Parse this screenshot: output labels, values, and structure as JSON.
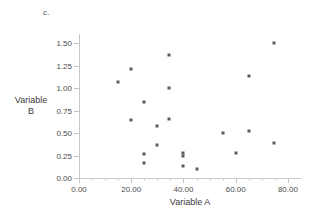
{
  "panel": {
    "label": "c."
  },
  "chart_data": {
    "type": "scatter",
    "title": "",
    "subtitle": "",
    "xlabel": "Variable A",
    "ylabel_line1": "Variable",
    "ylabel_line2": "B",
    "ylabel": "Variable B",
    "xlim": [
      0,
      85
    ],
    "ylim": [
      0,
      1.6
    ],
    "grid": false,
    "legend": null,
    "marker": {
      "shape": "square",
      "color": "#5a5a64",
      "size_px": 3
    },
    "xticks": [
      0,
      20,
      40,
      60,
      80
    ],
    "xtick_labels": [
      "0.00",
      "20.00",
      "40.00",
      "60.00",
      "80.00"
    ],
    "xticks_minor": [
      5,
      10,
      15,
      25,
      30,
      35,
      45,
      50,
      55,
      65,
      70,
      75
    ],
    "yticks": [
      0.0,
      0.25,
      0.5,
      0.75,
      1.0,
      1.25,
      1.5
    ],
    "ytick_labels": [
      "0.00",
      "0.25",
      "0.50",
      "0.75",
      "1.00",
      "1.25",
      "1.50"
    ],
    "points": [
      {
        "x": 15.0,
        "y": 1.07
      },
      {
        "x": 20.0,
        "y": 1.21
      },
      {
        "x": 20.0,
        "y": 0.64
      },
      {
        "x": 25.0,
        "y": 0.84
      },
      {
        "x": 25.0,
        "y": 0.27
      },
      {
        "x": 25.0,
        "y": 0.17
      },
      {
        "x": 30.0,
        "y": 0.58
      },
      {
        "x": 30.0,
        "y": 0.37
      },
      {
        "x": 34.5,
        "y": 1.37
      },
      {
        "x": 34.5,
        "y": 1.0
      },
      {
        "x": 34.5,
        "y": 0.66
      },
      {
        "x": 40.0,
        "y": 0.28
      },
      {
        "x": 40.0,
        "y": 0.25
      },
      {
        "x": 40.0,
        "y": 0.13
      },
      {
        "x": 45.0,
        "y": 0.1
      },
      {
        "x": 55.0,
        "y": 0.5
      },
      {
        "x": 60.0,
        "y": 0.28
      },
      {
        "x": 65.0,
        "y": 1.13
      },
      {
        "x": 65.0,
        "y": 0.52
      },
      {
        "x": 74.5,
        "y": 1.5
      },
      {
        "x": 74.5,
        "y": 0.39
      }
    ]
  }
}
